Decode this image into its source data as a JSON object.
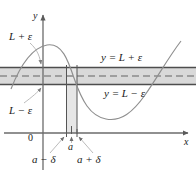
{
  "figure": {
    "axes": {
      "x_label": "x",
      "y_label": "y",
      "origin_label": "0"
    },
    "labels": {
      "upper_bound": "L + ε",
      "lower_bound": "L − ε",
      "upper_line": "y = L + ε",
      "lower_line": "y = L − ε",
      "point_a": "a",
      "a_minus_delta": "a − δ",
      "a_plus_delta": "a + δ"
    },
    "colors": {
      "curve": "#8a8a8a",
      "band_fill": "#d9d9d9",
      "band_edge": "#4d4d4d",
      "dashed_line": "#9a9a9a",
      "strip_fill": "#e0e0e0",
      "axis": "#6b6b6b",
      "leader": "#b0b0b0",
      "text": "#1a1a1a"
    },
    "geometry": {
      "band_top_y": 67,
      "band_bottom_y": 85,
      "band_mid_y": 76,
      "strip_left_x": 66,
      "strip_right_x": 77,
      "x_axis_y": 133,
      "y_axis_x": 43,
      "a_x": 71.5
    }
  }
}
